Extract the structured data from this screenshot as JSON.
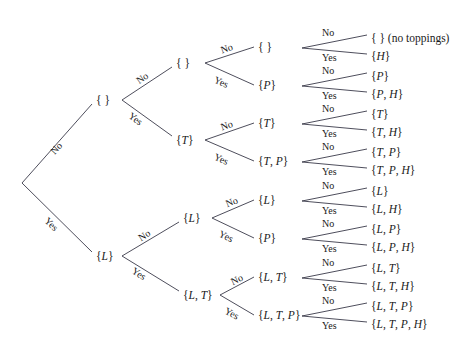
{
  "diagram": {
    "line_color": "#3a3a4a",
    "text_color": "#1a1a1a"
  },
  "columns": [
    {
      "id": "lettuce",
      "label": "Lettuce?",
      "x": 35,
      "y": 14
    },
    {
      "id": "tomato",
      "label": "Tomato?",
      "x": 128,
      "y": 14
    },
    {
      "id": "pickle",
      "label": "Pickle?",
      "x": 222,
      "y": 14
    },
    {
      "id": "hot_peppers",
      "label": "Hot peppers?",
      "x": 303,
      "y": 14
    },
    {
      "id": "toppings",
      "label": "Toppings",
      "x": 372,
      "y": 14
    }
  ],
  "nodes": [
    {
      "id": "root",
      "text": "",
      "x": 22,
      "y": 183,
      "anchor": "none"
    },
    {
      "id": "n-no",
      "text": "{ }",
      "x": 96,
      "y": 100,
      "anchor": "left"
    },
    {
      "id": "n-yes",
      "text": "{L}",
      "x": 96,
      "y": 256,
      "anchor": "left"
    },
    {
      "id": "n-nn",
      "text": "{ }",
      "x": 176,
      "y": 63,
      "anchor": "left"
    },
    {
      "id": "n-ny",
      "text": "{T}",
      "x": 176,
      "y": 140,
      "anchor": "left"
    },
    {
      "id": "n-yn",
      "text": "{L}",
      "x": 183,
      "y": 218,
      "anchor": "left"
    },
    {
      "id": "n-yy",
      "text": "{L, T}",
      "x": 183,
      "y": 295,
      "anchor": "left"
    },
    {
      "id": "p-1",
      "text": "{ }",
      "x": 258,
      "y": 47,
      "anchor": "left"
    },
    {
      "id": "p-2",
      "text": "{P}",
      "x": 258,
      "y": 85,
      "anchor": "left"
    },
    {
      "id": "p-3",
      "text": "{T}",
      "x": 258,
      "y": 123,
      "anchor": "left"
    },
    {
      "id": "p-4",
      "text": "{T, P}",
      "x": 258,
      "y": 161,
      "anchor": "left"
    },
    {
      "id": "p-5",
      "text": "{L}",
      "x": 258,
      "y": 200,
      "anchor": "left"
    },
    {
      "id": "p-6",
      "text": "{P}",
      "x": 258,
      "y": 238,
      "anchor": "left"
    },
    {
      "id": "p-7",
      "text": "{L, T}",
      "x": 258,
      "y": 277,
      "anchor": "left"
    },
    {
      "id": "p-8",
      "text": "{L, T, P}",
      "x": 258,
      "y": 315,
      "anchor": "left"
    }
  ],
  "leaves": [
    {
      "id": "leaf-1",
      "text": "{ }",
      "note": " (no toppings)",
      "x": 371,
      "y": 38
    },
    {
      "id": "leaf-2",
      "text": "{H}",
      "note": "",
      "x": 371,
      "y": 56
    },
    {
      "id": "leaf-3",
      "text": "{P}",
      "note": "",
      "x": 371,
      "y": 76
    },
    {
      "id": "leaf-4",
      "text": "{P, H}",
      "note": "",
      "x": 371,
      "y": 94
    },
    {
      "id": "leaf-5",
      "text": "{T}",
      "note": "",
      "x": 371,
      "y": 114
    },
    {
      "id": "leaf-6",
      "text": "{T, H}",
      "note": "",
      "x": 371,
      "y": 132
    },
    {
      "id": "leaf-7",
      "text": "{T, P}",
      "note": "",
      "x": 371,
      "y": 152
    },
    {
      "id": "leaf-8",
      "text": "{T, P, H}",
      "note": "",
      "x": 371,
      "y": 170
    },
    {
      "id": "leaf-9",
      "text": "{L}",
      "note": "",
      "x": 371,
      "y": 191
    },
    {
      "id": "leaf-10",
      "text": "{L, H}",
      "note": "",
      "x": 371,
      "y": 209
    },
    {
      "id": "leaf-11",
      "text": "{L, P}",
      "note": "",
      "x": 371,
      "y": 229
    },
    {
      "id": "leaf-12",
      "text": "{L, P, H}",
      "note": "",
      "x": 371,
      "y": 247
    },
    {
      "id": "leaf-13",
      "text": "{L, T}",
      "note": "",
      "x": 371,
      "y": 268
    },
    {
      "id": "leaf-14",
      "text": "{L, T, H}",
      "note": "",
      "x": 371,
      "y": 286
    },
    {
      "id": "leaf-15",
      "text": "{L, T, P}",
      "note": "",
      "x": 371,
      "y": 306
    },
    {
      "id": "leaf-16",
      "text": "{L, T, P, H}",
      "note": "",
      "x": 371,
      "y": 324
    }
  ],
  "edges": [
    {
      "id": "e-root-no",
      "x1": 22,
      "y1": 183,
      "x2": 92,
      "y2": 104
    },
    {
      "id": "e-root-yes",
      "x1": 22,
      "y1": 183,
      "x2": 92,
      "y2": 252
    },
    {
      "id": "e-no-nn",
      "x1": 122,
      "y1": 100,
      "x2": 172,
      "y2": 67
    },
    {
      "id": "e-no-ny",
      "x1": 122,
      "y1": 100,
      "x2": 172,
      "y2": 136
    },
    {
      "id": "e-yes-yn",
      "x1": 122,
      "y1": 256,
      "x2": 179,
      "y2": 222
    },
    {
      "id": "e-yes-yy",
      "x1": 122,
      "y1": 256,
      "x2": 179,
      "y2": 291
    },
    {
      "id": "e-nn-p1",
      "x1": 205,
      "y1": 63,
      "x2": 254,
      "y2": 47
    },
    {
      "id": "e-nn-p2",
      "x1": 205,
      "y1": 63,
      "x2": 254,
      "y2": 85
    },
    {
      "id": "e-ny-p3",
      "x1": 205,
      "y1": 140,
      "x2": 254,
      "y2": 123
    },
    {
      "id": "e-ny-p4",
      "x1": 205,
      "y1": 140,
      "x2": 254,
      "y2": 161
    },
    {
      "id": "e-yn-p5",
      "x1": 212,
      "y1": 218,
      "x2": 254,
      "y2": 200
    },
    {
      "id": "e-yn-p6",
      "x1": 212,
      "y1": 218,
      "x2": 254,
      "y2": 238
    },
    {
      "id": "e-yy-p7",
      "x1": 220,
      "y1": 295,
      "x2": 254,
      "y2": 277
    },
    {
      "id": "e-yy-p8",
      "x1": 220,
      "y1": 295,
      "x2": 254,
      "y2": 315
    },
    {
      "id": "e-h1-no",
      "x1": 302,
      "y1": 48,
      "x2": 367,
      "y2": 35
    },
    {
      "id": "e-h1-yes",
      "x1": 302,
      "y1": 48,
      "x2": 367,
      "y2": 54
    },
    {
      "id": "e-h2-no",
      "x1": 302,
      "y1": 86,
      "x2": 367,
      "y2": 73
    },
    {
      "id": "e-h2-yes",
      "x1": 302,
      "y1": 86,
      "x2": 367,
      "y2": 92
    },
    {
      "id": "e-h3-no",
      "x1": 302,
      "y1": 124,
      "x2": 367,
      "y2": 111
    },
    {
      "id": "e-h3-yes",
      "x1": 302,
      "y1": 124,
      "x2": 367,
      "y2": 130
    },
    {
      "id": "e-h4-no",
      "x1": 302,
      "y1": 162,
      "x2": 367,
      "y2": 149
    },
    {
      "id": "e-h4-yes",
      "x1": 302,
      "y1": 162,
      "x2": 367,
      "y2": 168
    },
    {
      "id": "e-h5-no",
      "x1": 302,
      "y1": 201,
      "x2": 367,
      "y2": 188
    },
    {
      "id": "e-h5-yes",
      "x1": 302,
      "y1": 201,
      "x2": 367,
      "y2": 207
    },
    {
      "id": "e-h6-no",
      "x1": 302,
      "y1": 239,
      "x2": 367,
      "y2": 226
    },
    {
      "id": "e-h6-yes",
      "x1": 302,
      "y1": 239,
      "x2": 367,
      "y2": 245
    },
    {
      "id": "e-h7-no",
      "x1": 302,
      "y1": 278,
      "x2": 367,
      "y2": 265
    },
    {
      "id": "e-h7-yes",
      "x1": 302,
      "y1": 278,
      "x2": 367,
      "y2": 284
    },
    {
      "id": "e-h8-no",
      "x1": 302,
      "y1": 316,
      "x2": 367,
      "y2": 303
    },
    {
      "id": "e-h8-yes",
      "x1": 302,
      "y1": 316,
      "x2": 367,
      "y2": 322
    }
  ],
  "edge_labels": [
    {
      "id": "lbl-root-no",
      "text": "No",
      "x": 48,
      "y": 149,
      "rotate": -48
    },
    {
      "id": "lbl-root-yes",
      "text": "Yes",
      "x": 50,
      "y": 215,
      "rotate": 44
    },
    {
      "id": "lbl-no-nn",
      "text": "No",
      "x": 134,
      "y": 77,
      "rotate": -35
    },
    {
      "id": "lbl-no-ny",
      "text": "Yes",
      "x": 133,
      "y": 110,
      "rotate": 36
    },
    {
      "id": "lbl-yes-yn",
      "text": "No",
      "x": 136,
      "y": 234,
      "rotate": -33
    },
    {
      "id": "lbl-yes-yy",
      "text": "Yes",
      "x": 136,
      "y": 265,
      "rotate": 33
    },
    {
      "id": "lbl-p1",
      "text": "No",
      "x": 219,
      "y": 45,
      "rotate": -19
    },
    {
      "id": "lbl-p2",
      "text": "Yes",
      "x": 217,
      "y": 74,
      "rotate": 24
    },
    {
      "id": "lbl-p3",
      "text": "No",
      "x": 219,
      "y": 122,
      "rotate": -19
    },
    {
      "id": "lbl-p4",
      "text": "Yes",
      "x": 217,
      "y": 151,
      "rotate": 24
    },
    {
      "id": "lbl-p5",
      "text": "No",
      "x": 224,
      "y": 199,
      "rotate": -22
    },
    {
      "id": "lbl-p6",
      "text": "Yes",
      "x": 222,
      "y": 228,
      "rotate": 26
    },
    {
      "id": "lbl-p7",
      "text": "No",
      "x": 229,
      "y": 277,
      "rotate": -25
    },
    {
      "id": "lbl-p8",
      "text": "Yes",
      "x": 228,
      "y": 305,
      "rotate": 28
    },
    {
      "id": "lbl-h1-no",
      "text": "No",
      "x": 322,
      "y": 27,
      "rotate": 0
    },
    {
      "id": "lbl-h1-yes",
      "text": "Yes",
      "x": 322,
      "y": 52,
      "rotate": 0
    },
    {
      "id": "lbl-h2-no",
      "text": "No",
      "x": 322,
      "y": 65,
      "rotate": 0
    },
    {
      "id": "lbl-h2-yes",
      "text": "Yes",
      "x": 322,
      "y": 90,
      "rotate": 0
    },
    {
      "id": "lbl-h3-no",
      "text": "No",
      "x": 322,
      "y": 103,
      "rotate": 0
    },
    {
      "id": "lbl-h3-yes",
      "text": "Yes",
      "x": 322,
      "y": 128,
      "rotate": 0
    },
    {
      "id": "lbl-h4-no",
      "text": "No",
      "x": 322,
      "y": 141,
      "rotate": 0
    },
    {
      "id": "lbl-h4-yes",
      "text": "Yes",
      "x": 322,
      "y": 166,
      "rotate": 0
    },
    {
      "id": "lbl-h5-no",
      "text": "No",
      "x": 322,
      "y": 180,
      "rotate": 0
    },
    {
      "id": "lbl-h5-yes",
      "text": "Yes",
      "x": 322,
      "y": 205,
      "rotate": 0
    },
    {
      "id": "lbl-h6-no",
      "text": "No",
      "x": 322,
      "y": 218,
      "rotate": 0
    },
    {
      "id": "lbl-h6-yes",
      "text": "Yes",
      "x": 322,
      "y": 243,
      "rotate": 0
    },
    {
      "id": "lbl-h7-no",
      "text": "No",
      "x": 322,
      "y": 257,
      "rotate": 0
    },
    {
      "id": "lbl-h7-yes",
      "text": "Yes",
      "x": 322,
      "y": 282,
      "rotate": 0
    },
    {
      "id": "lbl-h8-no",
      "text": "No",
      "x": 322,
      "y": 295,
      "rotate": 0
    },
    {
      "id": "lbl-h8-yes",
      "text": "Yes",
      "x": 322,
      "y": 320,
      "rotate": 0
    }
  ]
}
